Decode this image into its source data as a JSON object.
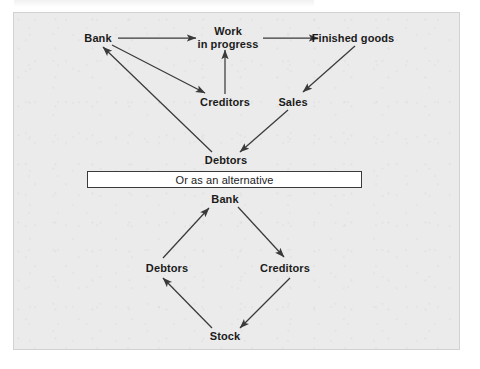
{
  "figure": {
    "background_color": "#ebebeb",
    "page_color": "#ffffff",
    "ink_color": "#3a3a3a",
    "text_color": "#1b1b1b"
  },
  "diagram_top": {
    "nodes": [
      {
        "id": "bank",
        "label": "Bank",
        "x": 98,
        "y": 38
      },
      {
        "id": "work_in_progress",
        "label": "Work\nin progress",
        "x": 228,
        "y": 37
      },
      {
        "id": "finished_goods",
        "label": "Finished goods",
        "x": 353,
        "y": 38
      },
      {
        "id": "creditors",
        "label": "Creditors",
        "x": 225,
        "y": 102
      },
      {
        "id": "sales",
        "label": "Sales",
        "x": 293,
        "y": 102
      },
      {
        "id": "debtors",
        "label": "Debtors",
        "x": 226,
        "y": 160
      }
    ],
    "edges": [
      {
        "from": "bank",
        "to": "work_in_progress"
      },
      {
        "from": "work_in_progress",
        "to": "finished_goods"
      },
      {
        "from": "bank",
        "to": "creditors"
      },
      {
        "from": "creditors",
        "to": "work_in_progress"
      },
      {
        "from": "finished_goods",
        "to": "sales"
      },
      {
        "from": "sales",
        "to": "debtors"
      },
      {
        "from": "debtors",
        "to": "bank"
      }
    ]
  },
  "divider": {
    "label": "Or as an alternative"
  },
  "diagram_bottom": {
    "nodes": [
      {
        "id": "bank2",
        "label": "Bank",
        "x": 225,
        "y": 199
      },
      {
        "id": "debtors2",
        "label": "Debtors",
        "x": 167,
        "y": 268
      },
      {
        "id": "creditors2",
        "label": "Creditors",
        "x": 285,
        "y": 268
      },
      {
        "id": "stock2",
        "label": "Stock",
        "x": 225,
        "y": 336
      }
    ],
    "edges": [
      {
        "from": "debtors2",
        "to": "bank2"
      },
      {
        "from": "bank2",
        "to": "creditors2"
      },
      {
        "from": "creditors2",
        "to": "stock2"
      },
      {
        "from": "stock2",
        "to": "debtors2"
      }
    ]
  }
}
